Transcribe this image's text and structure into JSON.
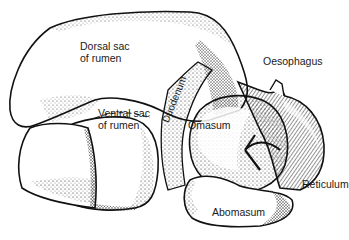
{
  "diagram": {
    "type": "anatomical illustration",
    "labels": {
      "dorsal_sac": "Dorsal sac\nof rumen",
      "ventral_sac": "Ventral sac\nof rumen",
      "duodenum": "Duodenum",
      "oesophagus": "Oesophagus",
      "omasum": "Omasum",
      "reticulum": "Reticulum",
      "abomasum": "Abomasum"
    },
    "colors": {
      "ink": "#111111",
      "background": "#ffffff"
    }
  }
}
